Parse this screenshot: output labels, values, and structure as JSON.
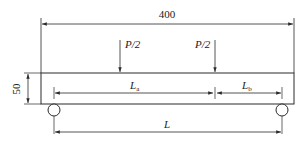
{
  "diagram": {
    "type": "four-point bending beam schematic",
    "colors": {
      "line": "#2a2a2a",
      "background": "#ffffff"
    },
    "dimensions": {
      "total_length": {
        "label": "400"
      },
      "height": {
        "label": "50"
      },
      "span": {
        "label": "L"
      },
      "segment_a": {
        "label": "L",
        "subscript": "a"
      },
      "segment_b": {
        "label": "L",
        "subscript": "b"
      }
    },
    "loads": [
      {
        "label": "P/2"
      },
      {
        "label": "P/2"
      }
    ],
    "supports": [
      {
        "type": "roller"
      },
      {
        "type": "roller"
      }
    ]
  }
}
